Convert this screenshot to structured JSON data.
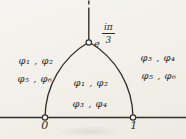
{
  "figure": {
    "ink_color": "#33302c",
    "background_color": "#f4f2ee",
    "regions": {
      "left_outside": {
        "line1": "φ₁ , φ₂",
        "line2": "φ₅ , φ₆"
      },
      "right_outside": {
        "line1": "φ₃ , φ₄",
        "line2": "φ₅ , φ₆"
      },
      "inside_arch": {
        "line1": "φ₁ , φ₂",
        "line2": "φ₃ , φ₄"
      }
    },
    "apex_label": {
      "base": "e",
      "exponent_numerator": "iπ",
      "exponent_denominator": "3"
    },
    "axis_points": {
      "zero": "0",
      "one": "1"
    }
  }
}
